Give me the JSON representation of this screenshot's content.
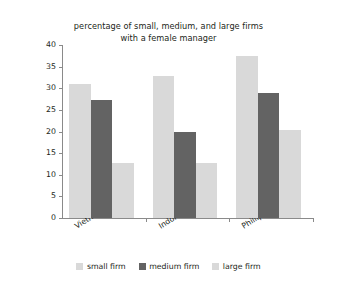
{
  "chart_data": {
    "type": "bar",
    "title": "percentage of small, medium, and large firms with a female manager",
    "title_lines": [
      "percentage of small, medium, and large firms",
      "with a female manager"
    ],
    "xlabel": "",
    "ylabel": "percent",
    "ylim": [
      0,
      40
    ],
    "ytick_step": 5,
    "yticks": [
      0,
      5,
      10,
      15,
      20,
      25,
      30,
      35,
      40
    ],
    "grid": false,
    "legend_position": "bottom",
    "categories": [
      "Vietnam",
      "Indonesia",
      "Phillippines"
    ],
    "series": [
      {
        "name": "small firm",
        "color": "#d9d9d9",
        "values": [
          31.0,
          32.8,
          37.5
        ]
      },
      {
        "name": "medium firm",
        "color": "#636363",
        "values": [
          27.3,
          20.0,
          28.8
        ]
      },
      {
        "name": "large firm",
        "color": "#d9d9d9",
        "values": [
          12.8,
          12.8,
          20.3
        ]
      }
    ]
  },
  "axes": {
    "y_title": "percent",
    "y_tick_labels": [
      "0",
      "5",
      "10",
      "15",
      "20",
      "25",
      "30",
      "35",
      "40"
    ],
    "x_tick_labels": [
      "Vietnam",
      "Indonesia",
      "Phillippines"
    ]
  },
  "legend": {
    "entries": [
      {
        "label": "small firm",
        "color": "#d9d9d9"
      },
      {
        "label": "medium firm",
        "color": "#636363"
      },
      {
        "label": "large firm",
        "color": "#d9d9d9"
      }
    ]
  },
  "style": {
    "axis_color": "#8a8a8a",
    "text_color": "#231f20",
    "background": "#ffffff",
    "light_bar": "#d9d9d9",
    "dark_bar": "#636363"
  }
}
